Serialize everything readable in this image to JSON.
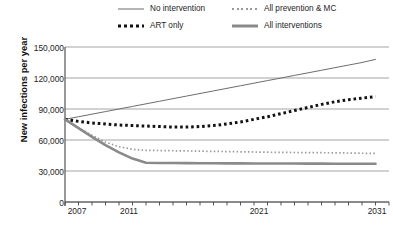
{
  "legend": {
    "items": [
      {
        "label": "No intervention",
        "style": "thin-solid",
        "color": "#6d6d6d"
      },
      {
        "label": "All prevention & MC",
        "style": "fine-dotted",
        "color": "#9a9a9a"
      },
      {
        "label": "ART only",
        "style": "bold-dotted",
        "color": "#111111"
      },
      {
        "label": "All interventions",
        "style": "thick-solid",
        "color": "#8a8a8a"
      }
    ]
  },
  "axes": {
    "y_title": "New infections per year",
    "y_ticks": [
      "150,000",
      "120,000",
      "90,000",
      "60,000",
      "30,000",
      "0"
    ],
    "x_ticks": [
      "2007",
      "2011",
      "2021",
      "2031"
    ]
  },
  "caption": "",
  "chart_data": {
    "type": "line",
    "title": "",
    "xlabel": "",
    "ylabel": "New infections per year",
    "xlim": [
      2007,
      2031
    ],
    "ylim": [
      0,
      150000
    ],
    "ytick_values": [
      0,
      30000,
      60000,
      90000,
      120000,
      150000
    ],
    "xtick_values": [
      2007,
      2011,
      2021,
      2031
    ],
    "grid": "horizontal",
    "legend_position": "above-plot",
    "x": [
      2007,
      2008,
      2009,
      2010,
      2011,
      2012,
      2013,
      2014,
      2015,
      2016,
      2017,
      2018,
      2019,
      2020,
      2021,
      2022,
      2023,
      2024,
      2025,
      2026,
      2027,
      2028,
      2029,
      2030
    ],
    "series": [
      {
        "name": "No intervention",
        "style": "thin-solid",
        "color": "#6d6d6d",
        "values": [
          80000,
          82500,
          85000,
          87500,
          90000,
          92500,
          95000,
          97500,
          100000,
          102500,
          105000,
          107500,
          110000,
          112500,
          115000,
          117500,
          120000,
          122500,
          125000,
          127500,
          130000,
          132500,
          135000,
          138000
        ]
      },
      {
        "name": "ART only",
        "style": "bold-dotted",
        "color": "#111111",
        "values": [
          80000,
          78000,
          76500,
          75500,
          74500,
          74000,
          73500,
          73000,
          72500,
          72500,
          73000,
          74000,
          75500,
          77500,
          80000,
          82500,
          85500,
          88500,
          91500,
          94500,
          97000,
          99000,
          100500,
          102000
        ]
      },
      {
        "name": "All prevention & MC",
        "style": "fine-dotted",
        "color": "#9a9a9a",
        "values": [
          80000,
          72000,
          64500,
          58000,
          53500,
          51000,
          50000,
          49800,
          49600,
          49400,
          49200,
          49000,
          48800,
          48600,
          48400,
          48200,
          48000,
          47900,
          47800,
          47700,
          47600,
          47400,
          47200,
          47000
        ]
      },
      {
        "name": "All interventions",
        "style": "thick-solid",
        "color": "#8a8a8a",
        "values": [
          80000,
          71500,
          63000,
          55000,
          48000,
          42000,
          38000,
          37800,
          37700,
          37600,
          37500,
          37500,
          37400,
          37400,
          37300,
          37300,
          37200,
          37200,
          37100,
          37100,
          37000,
          37000,
          37000,
          37000
        ]
      }
    ]
  }
}
